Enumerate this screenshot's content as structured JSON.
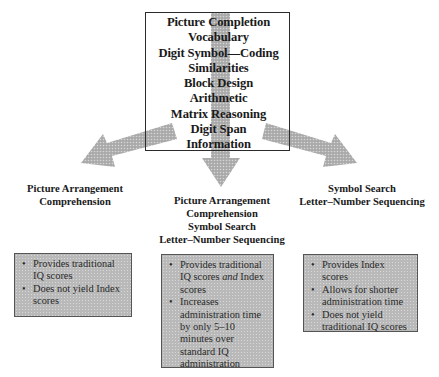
{
  "core_subtests": {
    "items": [
      "Picture Completion",
      "Vocabulary",
      "Digit Symbol—Coding",
      "Similarities",
      "Block Design",
      "Arithmetic",
      "Matrix Reasoning",
      "Digit Span",
      "Information"
    ]
  },
  "branches": [
    {
      "label_lines": [
        "Picture Arrangement",
        "Comprehension"
      ],
      "notes": [
        {
          "text": "Provides traditional IQ scores"
        },
        {
          "text": "Does not yield Index scores"
        }
      ]
    },
    {
      "label_lines": [
        "Picture Arrangement",
        "Comprehension",
        "Symbol Search",
        "Letter–Number Sequencing"
      ],
      "notes": [
        {
          "text_before": "Provides traditional IQ scores ",
          "emphasis": "and",
          "text_after": " Index scores"
        },
        {
          "text": "Increases administration time by only 5–10 minutes over standard IQ administration"
        }
      ]
    },
    {
      "label_lines": [
        "Symbol Search",
        "Letter–Number Sequencing"
      ],
      "notes": [
        {
          "text": "Provides Index scores"
        },
        {
          "text": "Allows for shorter administration time"
        },
        {
          "text": "Does not yield traditional IQ scores"
        }
      ]
    }
  ],
  "bullet_glyph": "•",
  "colors": {
    "arrow_fill": "#b5b5b5",
    "note_fill": "#b9b9b9",
    "box_border": "#2b2b2b"
  }
}
